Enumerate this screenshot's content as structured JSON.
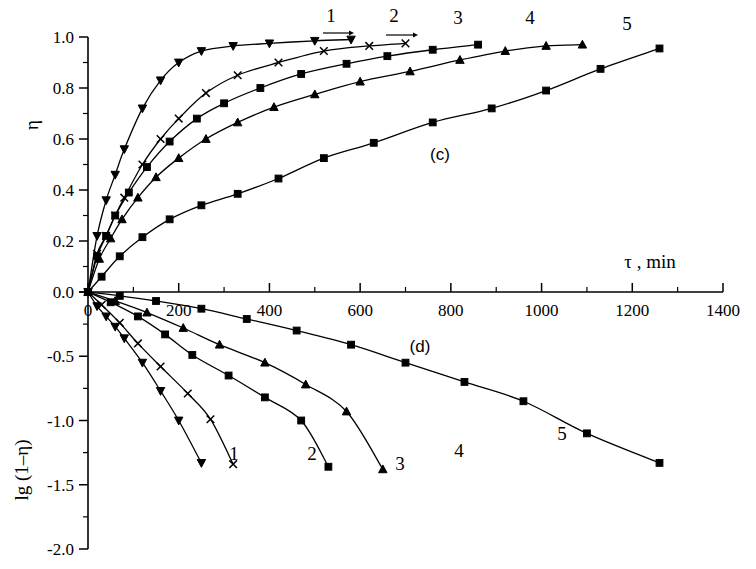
{
  "figure": {
    "panels": [
      {
        "id": "c",
        "label": "(c)",
        "label_x": 440,
        "label_y": 160
      },
      {
        "id": "d",
        "label": "(d)",
        "label_x": 420,
        "label_y": 352
      }
    ],
    "xaxis": {
      "title": "τ , min",
      "title_x": 650,
      "title_y": 268,
      "min": 0,
      "max": 1400,
      "ticks": [
        0,
        200,
        400,
        600,
        800,
        1000,
        1200,
        1400
      ],
      "tick_labels": [
        "0",
        "200",
        "400",
        "600",
        "800",
        "1000",
        "1200",
        "1400"
      ],
      "minor_step": 100
    },
    "yaxis_top": {
      "title": "η",
      "min": 0.0,
      "max": 1.0,
      "ticks": [
        0.0,
        0.2,
        0.4,
        0.6,
        0.8,
        1.0
      ],
      "tick_labels": [
        "0.0",
        "0.2",
        "0.4",
        "0.6",
        "0.8",
        "1.0"
      ],
      "minor_step": 0.1
    },
    "yaxis_bottom": {
      "title": "lg (1–η)",
      "min": -2.0,
      "max": 0.0,
      "ticks": [
        -2.0,
        -1.5,
        -1.0,
        -0.5,
        0.0
      ],
      "tick_labels": [
        "-2.0",
        "-1.5",
        "-1.0",
        "-0.5",
        "0.0"
      ],
      "minor_step": 0.25
    },
    "curve_labels_top": [
      {
        "text": "1",
        "x": 331,
        "y": 22
      },
      {
        "text": "2",
        "x": 394,
        "y": 22
      },
      {
        "text": "3",
        "x": 458,
        "y": 24
      },
      {
        "text": "4",
        "x": 530,
        "y": 24
      },
      {
        "text": "5",
        "x": 627,
        "y": 30
      }
    ],
    "curve_labels_bottom": [
      {
        "text": "1",
        "x": 234,
        "y": 460
      },
      {
        "text": "2",
        "x": 312,
        "y": 460
      },
      {
        "text": "3",
        "x": 400,
        "y": 470
      },
      {
        "text": "4",
        "x": 459,
        "y": 457
      },
      {
        "text": "5",
        "x": 562,
        "y": 440
      }
    ]
  },
  "chart_data": [
    {
      "type": "line",
      "panel": "c",
      "title": "(c)",
      "xlabel": "τ , min",
      "ylabel": "η",
      "xlim": [
        0,
        1400
      ],
      "ylim": [
        0.0,
        1.0
      ],
      "grid": false,
      "legend": "curve numbers 1-5 annotated on curves",
      "series": [
        {
          "name": "1",
          "marker": "down-triangle",
          "x": [
            0,
            20,
            40,
            60,
            80,
            120,
            160,
            200,
            250,
            320,
            400,
            500,
            580
          ],
          "y": [
            0.0,
            0.22,
            0.36,
            0.46,
            0.56,
            0.72,
            0.83,
            0.9,
            0.945,
            0.965,
            0.975,
            0.985,
            0.99
          ]
        },
        {
          "name": "2",
          "marker": "cross",
          "x": [
            0,
            20,
            40,
            60,
            80,
            120,
            160,
            200,
            260,
            330,
            420,
            520,
            620,
            700
          ],
          "y": [
            0.0,
            0.15,
            0.22,
            0.3,
            0.37,
            0.5,
            0.6,
            0.68,
            0.78,
            0.85,
            0.9,
            0.945,
            0.965,
            0.975
          ]
        },
        {
          "name": "3",
          "marker": "square",
          "x": [
            0,
            20,
            40,
            60,
            90,
            130,
            180,
            240,
            300,
            380,
            470,
            570,
            660,
            760,
            860
          ],
          "y": [
            0.0,
            0.14,
            0.22,
            0.3,
            0.39,
            0.49,
            0.59,
            0.68,
            0.74,
            0.8,
            0.855,
            0.895,
            0.925,
            0.95,
            0.97
          ]
        },
        {
          "name": "4",
          "marker": "up-triangle",
          "x": [
            0,
            25,
            50,
            75,
            110,
            150,
            200,
            260,
            330,
            410,
            500,
            600,
            710,
            820,
            920,
            1010,
            1090
          ],
          "y": [
            0.0,
            0.13,
            0.21,
            0.285,
            0.37,
            0.45,
            0.525,
            0.6,
            0.665,
            0.725,
            0.775,
            0.825,
            0.865,
            0.91,
            0.945,
            0.965,
            0.97
          ]
        },
        {
          "name": "5",
          "marker": "square",
          "x": [
            0,
            30,
            70,
            120,
            180,
            250,
            330,
            420,
            520,
            630,
            760,
            890,
            1010,
            1130,
            1260
          ],
          "y": [
            0.0,
            0.06,
            0.14,
            0.215,
            0.285,
            0.34,
            0.385,
            0.445,
            0.525,
            0.585,
            0.665,
            0.72,
            0.79,
            0.875,
            0.955
          ]
        }
      ]
    },
    {
      "type": "line",
      "panel": "d",
      "title": "(d)",
      "xlabel": "τ , min",
      "ylabel": "lg (1–η)",
      "xlim": [
        0,
        1400
      ],
      "ylim": [
        -2.0,
        0.0
      ],
      "grid": false,
      "legend": "curve numbers 1-5 annotated at line ends",
      "series": [
        {
          "name": "1",
          "marker": "down-triangle",
          "x": [
            0,
            20,
            40,
            60,
            80,
            120,
            160,
            200,
            250
          ],
          "y": [
            0.0,
            -0.11,
            -0.19,
            -0.27,
            -0.36,
            -0.55,
            -0.77,
            -1.0,
            -1.33
          ]
        },
        {
          "name": "2",
          "marker": "cross",
          "x": [
            0,
            30,
            70,
            110,
            160,
            220,
            270,
            320
          ],
          "y": [
            0.0,
            -0.1,
            -0.24,
            -0.4,
            -0.58,
            -0.79,
            -0.99,
            -1.34
          ]
        },
        {
          "name": "3",
          "marker": "square",
          "x": [
            0,
            50,
            110,
            170,
            230,
            310,
            390,
            470,
            530
          ],
          "y": [
            0.0,
            -0.08,
            -0.19,
            -0.33,
            -0.49,
            -0.65,
            -0.82,
            -1.0,
            -1.36
          ]
        },
        {
          "name": "4",
          "marker": "up-triangle",
          "x": [
            0,
            60,
            130,
            210,
            290,
            390,
            480,
            570,
            650
          ],
          "y": [
            0.0,
            -0.07,
            -0.16,
            -0.28,
            -0.41,
            -0.55,
            -0.72,
            -0.93,
            -1.38
          ]
        },
        {
          "name": "5",
          "marker": "square",
          "x": [
            0,
            70,
            150,
            250,
            350,
            460,
            580,
            700,
            830,
            960,
            1100,
            1260
          ],
          "y": [
            0.0,
            -0.03,
            -0.07,
            -0.13,
            -0.21,
            -0.3,
            -0.41,
            -0.55,
            -0.7,
            -0.85,
            -1.1,
            -1.33
          ]
        }
      ]
    }
  ]
}
